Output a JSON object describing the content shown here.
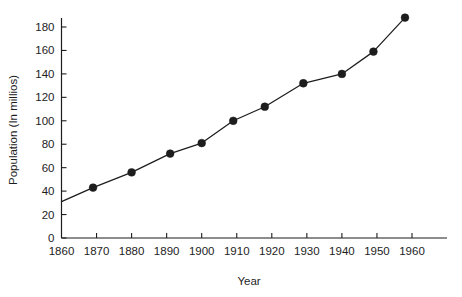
{
  "chart_data": {
    "type": "line",
    "title": "",
    "xlabel": "Year",
    "ylabel": "Population (In millios)",
    "x": [
      1860,
      1869,
      1880,
      1891,
      1900,
      1909,
      1918,
      1929,
      1940,
      1949,
      1958
    ],
    "values": [
      31,
      43,
      56,
      72,
      81,
      100,
      112,
      132,
      140,
      159,
      188
    ],
    "series": [
      {
        "name": "Population",
        "values": [
          31,
          43,
          56,
          72,
          81,
          100,
          112,
          132,
          140,
          159,
          188
        ]
      }
    ],
    "marker_points": [
      {
        "x": 1869,
        "y": 43
      },
      {
        "x": 1880,
        "y": 56
      },
      {
        "x": 1891,
        "y": 72
      },
      {
        "x": 1900,
        "y": 81
      },
      {
        "x": 1909,
        "y": 100
      },
      {
        "x": 1918,
        "y": 112
      },
      {
        "x": 1929,
        "y": 132
      },
      {
        "x": 1940,
        "y": 140
      },
      {
        "x": 1949,
        "y": 159
      },
      {
        "x": 1958,
        "y": 188
      }
    ],
    "xlim": [
      1860,
      1965
    ],
    "ylim": [
      0,
      190
    ],
    "xticks": [
      1860,
      1870,
      1880,
      1890,
      1900,
      1910,
      1920,
      1930,
      1940,
      1950,
      1960
    ],
    "xtick_labels": [
      "1860",
      "1870",
      "1880",
      "1890",
      "1900",
      "1910",
      "1920",
      "1930",
      "1940",
      "1950",
      "1960"
    ],
    "yticks": [
      0,
      20,
      40,
      60,
      80,
      100,
      120,
      140,
      160,
      180
    ],
    "ytick_labels": [
      "0",
      "20",
      "40",
      "60",
      "80",
      "100",
      "120",
      "140",
      "160",
      "180"
    ],
    "grid": false,
    "legend": null,
    "legend_position": "none",
    "line_color": "#1d1d1d",
    "marker_color": "#1d1d1d",
    "background_color": "#ffffff"
  }
}
